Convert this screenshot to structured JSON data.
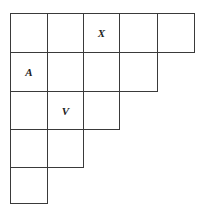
{
  "diagram": {
    "type": "staircase-grid",
    "col_edges": [
      10,
      47,
      83,
      119,
      157,
      194
    ],
    "row_edges": [
      13,
      52,
      91,
      129,
      167,
      203
    ],
    "row_lengths": [
      5,
      4,
      3,
      2,
      1
    ],
    "labels": [
      {
        "row": 0,
        "col": 2,
        "text": "X"
      },
      {
        "row": 1,
        "col": 0,
        "text": "A"
      },
      {
        "row": 2,
        "col": 1,
        "text": "V"
      }
    ],
    "line_color": "#3a3a3a"
  }
}
